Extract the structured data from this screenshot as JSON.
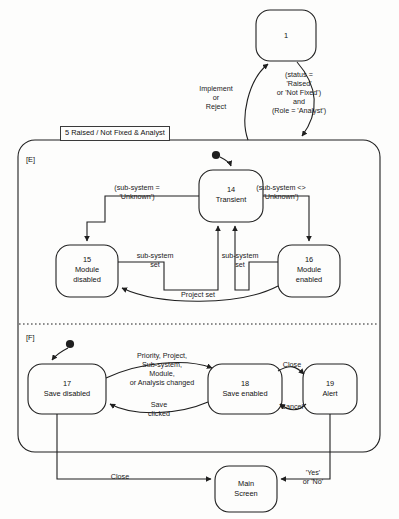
{
  "diagram": {
    "type": "uml-state-diagram",
    "container": {
      "title": "5 Raised / Not Fixed & Analyst",
      "regions": [
        {
          "tag": "[E]"
        },
        {
          "tag": "[F]"
        }
      ]
    },
    "states": [
      {
        "id": "1",
        "number": "1",
        "name": ""
      },
      {
        "id": "14",
        "number": "14",
        "name": "Transient"
      },
      {
        "id": "15",
        "number": "15",
        "name": "Module\ndisabled"
      },
      {
        "id": "16",
        "number": "16",
        "name": "Module\nenabled"
      },
      {
        "id": "17",
        "number": "17",
        "name": "Save disabled"
      },
      {
        "id": "18",
        "number": "18",
        "name": "Save enabled"
      },
      {
        "id": "19",
        "number": "19",
        "name": "Alert"
      },
      {
        "id": "main",
        "number": "",
        "name": "Main\nScreen"
      }
    ],
    "transitions": [
      {
        "from": "container",
        "to": "1",
        "label": "Implement\nor\nReject"
      },
      {
        "from": "1",
        "to": "container",
        "label": "(status =\n'Raised'\nor 'Not Fixed')\nand\n(Role = 'Analyst')"
      },
      {
        "from": "14",
        "to": "15",
        "label": "(sub-system =\n'Unknown')"
      },
      {
        "from": "14",
        "to": "16",
        "label": "(sub-system <>\n'Unknown')"
      },
      {
        "from": "15",
        "to": "14",
        "label": "sub-system\nset"
      },
      {
        "from": "16",
        "to": "14",
        "label": "sub-system\nset"
      },
      {
        "from": "16",
        "to": "15",
        "label": "Project set"
      },
      {
        "from": "17",
        "to": "18",
        "label": "Priority, Project,\nSub-system,\nModule,\nor Analysis changed"
      },
      {
        "from": "18",
        "to": "17",
        "label": "Save\nclicked"
      },
      {
        "from": "18",
        "to": "19",
        "label": "Close"
      },
      {
        "from": "19",
        "to": "18",
        "label": "'Cancel'"
      },
      {
        "from": "17",
        "to": "main",
        "label": "Close"
      },
      {
        "from": "19",
        "to": "main",
        "label": "'Yes'\nor 'No'"
      }
    ]
  },
  "colors": {
    "stroke": "#1f1f1f",
    "background": "#fdfdfc",
    "text": "#111111"
  }
}
